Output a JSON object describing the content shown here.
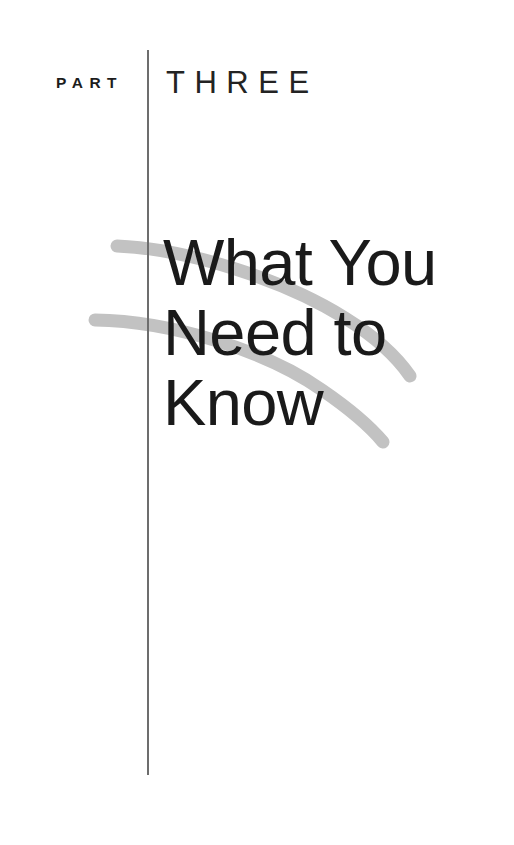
{
  "page": {
    "background_color": "#ffffff",
    "width": 514,
    "height": 845
  },
  "part_header": {
    "label": "PART",
    "number_word": "THREE",
    "divider": "vertical-rule",
    "text_color": "#1c1c1c"
  },
  "title": {
    "lines": [
      "What You",
      "Need to",
      "Know"
    ],
    "full_text": "What You Need to Know",
    "text_color": "#1a1a1a"
  },
  "decoration": {
    "swoosh_color": "#c2c2c2",
    "swoosh_count": 2,
    "description": "two gray tapered arcs sweeping from upper left down to the right behind the title"
  }
}
